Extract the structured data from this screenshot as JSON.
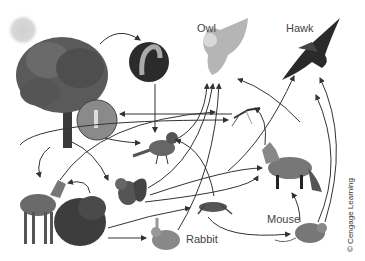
{
  "diagram": {
    "type": "food-web",
    "organisms": [
      {
        "id": "sun",
        "label": ""
      },
      {
        "id": "tree",
        "label": ""
      },
      {
        "id": "caterpillar",
        "label": ""
      },
      {
        "id": "insect-closeup",
        "label": ""
      },
      {
        "id": "owl",
        "label": "Owl"
      },
      {
        "id": "hawk",
        "label": "Hawk"
      },
      {
        "id": "mosquito",
        "label": ""
      },
      {
        "id": "blue-jay",
        "label": ""
      },
      {
        "id": "fox",
        "label": ""
      },
      {
        "id": "squirrel",
        "label": ""
      },
      {
        "id": "deer",
        "label": ""
      },
      {
        "id": "shrub",
        "label": ""
      },
      {
        "id": "grasshopper",
        "label": ""
      },
      {
        "id": "rabbit",
        "label": "Rabbit"
      },
      {
        "id": "mouse",
        "label": "Mouse"
      }
    ],
    "credit": "© Cengage Learning"
  }
}
